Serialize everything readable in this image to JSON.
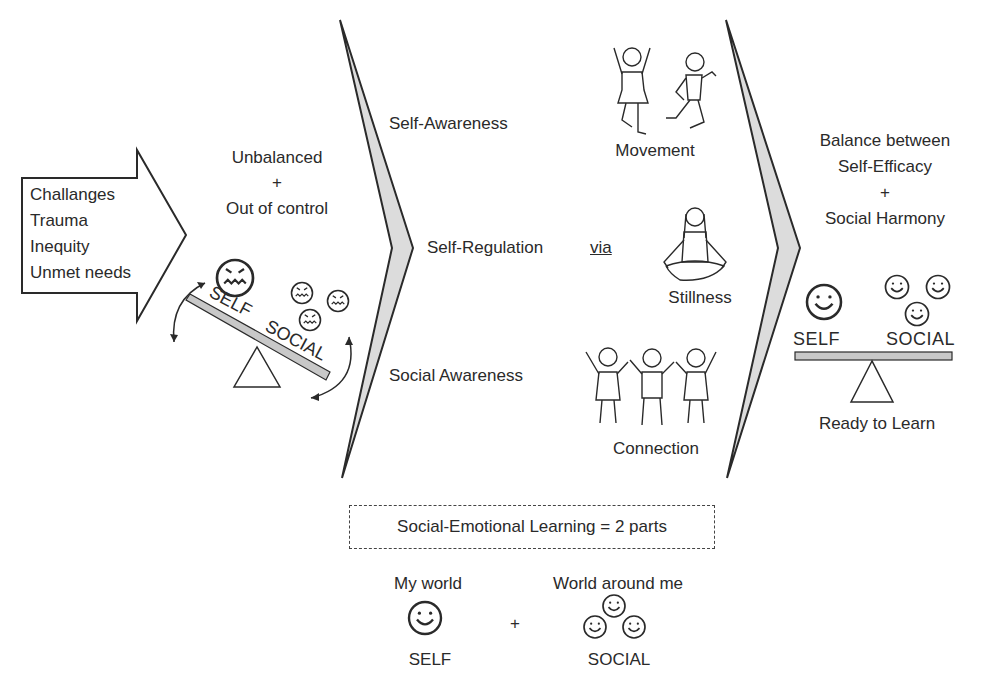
{
  "input_arrow": {
    "items": [
      "Challanges",
      "Trauma",
      "Inequity",
      "Unmet needs"
    ]
  },
  "unbalanced_state": {
    "line1": "Unbalanced",
    "plus": "+",
    "line2": "Out of control",
    "self_label": "SELF",
    "social_label": "SOCIAL"
  },
  "skills": {
    "self_awareness": "Self-Awareness",
    "self_regulation": "Self-Regulation",
    "via": "via",
    "social_awareness": "Social Awareness"
  },
  "practices": {
    "movement": "Movement",
    "stillness": "Stillness",
    "connection": "Connection"
  },
  "balanced_state": {
    "line1": "Balance between",
    "line2": "Self-Efficacy",
    "plus": "+",
    "line3": "Social Harmony",
    "self_label": "SELF",
    "social_label": "SOCIAL",
    "caption": "Ready to Learn"
  },
  "sel_definition": {
    "title": "Social-Emotional Learning = 2 parts",
    "left_heading": "My world",
    "left_label": "SELF",
    "plus": "+",
    "right_heading": "World around me",
    "right_label": "SOCIAL"
  },
  "colors": {
    "line": "#2a2a2a",
    "fill_gray": "#c8c8c8",
    "chevron_fill": "#dcdcdc"
  }
}
